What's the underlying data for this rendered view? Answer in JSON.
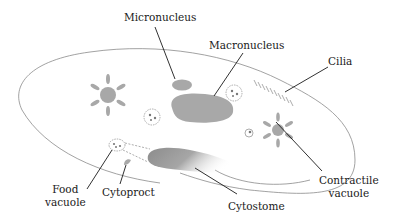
{
  "diagram": {
    "colors": {
      "outline": "#8a8a8a",
      "organelle_fill": "#a8a8a8",
      "leader_line": "#1a1a1a",
      "background": "#ffffff"
    },
    "labels": {
      "micronucleus": "Micronucleus",
      "macronucleus": "Macronucleus",
      "cilia": "Cilia",
      "food_vacuole_line1": "Food",
      "food_vacuole_line2": "vacuole",
      "cytoproct": "Cytoproct",
      "cytostome": "Cytostome",
      "contractile_vacuole_line1": "Contractile",
      "contractile_vacuole_line2": "vacuole"
    }
  }
}
